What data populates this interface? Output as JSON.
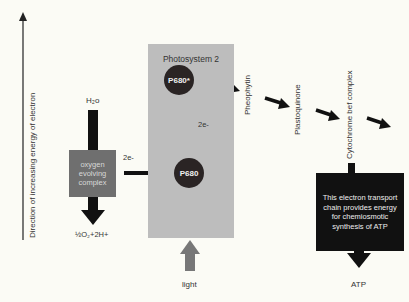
{
  "axis": {
    "label": "Direction of increasing energy of electron"
  },
  "water": {
    "label": "H₂o"
  },
  "oxygen_complex": {
    "label": "oxygen evolving complex",
    "color": "#6f6f6f"
  },
  "oxygen_output": {
    "label": "½O₂+2H+"
  },
  "photosystem": {
    "title": "Photosystem 2",
    "color": "#bdbdbd",
    "p680_star": "P680*",
    "p680": "P680",
    "electrons_in": "2e-",
    "electrons_up": "2e-"
  },
  "light": {
    "label": "light",
    "color": "#777777"
  },
  "chain": [
    {
      "label": "Pheophytin"
    },
    {
      "label": "Plastoquinone"
    },
    {
      "label": "Cytochrome bef complex"
    }
  ],
  "etc_box": {
    "text": "This electron transport chain provides energy for chemiosmotic synthesis of ATP"
  },
  "atp": {
    "label": "ATP"
  }
}
